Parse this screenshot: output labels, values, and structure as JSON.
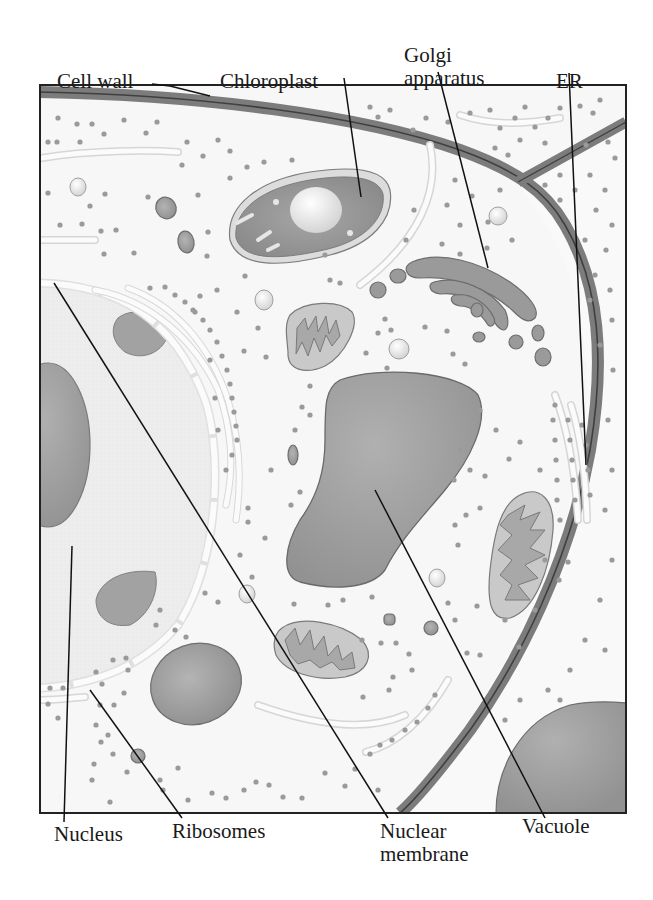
{
  "diagram": {
    "colors": {
      "background": "#ffffff",
      "cytoplasm": "#f6f6f6",
      "nucleoplasm": "#ececec",
      "organelle_fill": "#9c9c9c",
      "organelle_stroke": "#6e6e6e",
      "cell_wall": "#7a7a7a",
      "ribosome": "#9a9a9a",
      "membrane_tube": "#fbfbfb",
      "leader_line": "#111111",
      "frame": "#222222"
    },
    "labels": {
      "cell_wall": "Cell wall",
      "chloroplast": "Chloroplast",
      "golgi_line1": "Golgi",
      "golgi_line2": "apparatus",
      "er": "ER",
      "nucleus": "Nucleus",
      "ribosomes": "Ribosomes",
      "nuclear_membrane_line1": "Nuclear",
      "nuclear_membrane_line2": "membrane",
      "vacuole": "Vacuole"
    }
  }
}
